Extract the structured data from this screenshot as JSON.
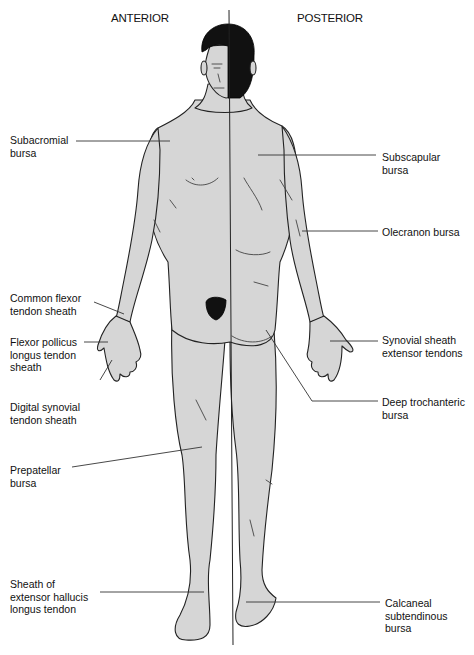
{
  "headings": {
    "anterior": "ANTERIOR",
    "posterior": "POSTERIOR"
  },
  "labels": {
    "subacromial": "Subacromial\nbursa",
    "common_flexor": "Common flexor\ntendon sheath",
    "flexor_pollicus": "Flexor pollicus\nlongus tendon\nsheath",
    "digital_synovial": "Digital synovial\ntendon sheath",
    "prepatellar": "Prepatellar\nbursa",
    "sheath_extensor_hallucis": "Sheath of\nextensor hallucis\nlongus tendon",
    "subscapular": "Subscapular\nbursa",
    "olecranon": "Olecranon bursa",
    "synovial_sheath_extensor": "Synovial sheath\nextensor tendons",
    "deep_trochanteric": "Deep trochanteric\nbursa",
    "calcaneal": "Calcaneal\nsubtendinous\nbursa"
  },
  "colors": {
    "skin": "#d6d6d6",
    "outline": "#222222",
    "hair": "#111111"
  }
}
